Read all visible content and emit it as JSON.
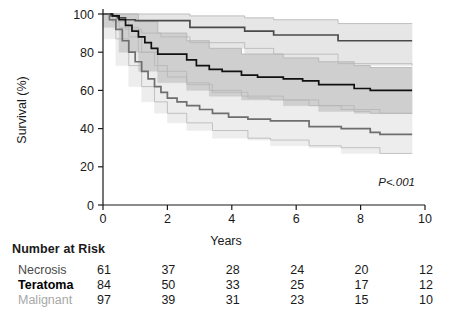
{
  "chart_data": {
    "type": "line",
    "title": "",
    "xlabel": "Years",
    "ylabel": "Survival (%)",
    "xlim": [
      0,
      10
    ],
    "ylim": [
      0,
      100
    ],
    "xticks": [
      0,
      2,
      4,
      6,
      8,
      10
    ],
    "yticks": [
      0,
      20,
      40,
      60,
      80,
      100
    ],
    "xtick_labels": [
      "0",
      "2",
      "4",
      "6",
      "8",
      "10"
    ],
    "ytick_labels": [
      "0",
      "20",
      "40",
      "60",
      "80",
      "100"
    ],
    "grid": false,
    "legend_position": "none",
    "annotation": "P<.001",
    "series": [
      {
        "name": "Necrosis",
        "color": "#4a4a4a",
        "band_color": "#e6e6e6",
        "points": [
          [
            0,
            100
          ],
          [
            0.25,
            99
          ],
          [
            0.45,
            98
          ],
          [
            0.7,
            97
          ],
          [
            1.0,
            96.5
          ],
          [
            1.6,
            96.5
          ],
          [
            2.6,
            96.5
          ],
          [
            2.7,
            93
          ],
          [
            4.3,
            93
          ],
          [
            4.4,
            91
          ],
          [
            5.2,
            91
          ],
          [
            5.3,
            89
          ],
          [
            7.2,
            89
          ],
          [
            7.3,
            86
          ],
          [
            9.6,
            86
          ]
        ],
        "band_upper": [
          [
            0,
            100
          ],
          [
            0.45,
            100
          ],
          [
            1.6,
            100
          ],
          [
            2.7,
            99
          ],
          [
            4.4,
            98
          ],
          [
            5.3,
            97
          ],
          [
            7.3,
            95
          ],
          [
            9.6,
            95
          ]
        ],
        "band_lower": [
          [
            0,
            100
          ],
          [
            0.3,
            96
          ],
          [
            0.7,
            92
          ],
          [
            1.2,
            90
          ],
          [
            1.8,
            88
          ],
          [
            2.7,
            85
          ],
          [
            4.4,
            82
          ],
          [
            5.3,
            79
          ],
          [
            7.3,
            74
          ],
          [
            9.6,
            73
          ]
        ],
        "final_value": 86
      },
      {
        "name": "Teratoma",
        "color": "#111111",
        "band_color": "#cfcfcf",
        "points": [
          [
            0,
            100
          ],
          [
            0.3,
            99
          ],
          [
            0.5,
            97
          ],
          [
            0.7,
            94
          ],
          [
            0.9,
            91
          ],
          [
            1.1,
            88
          ],
          [
            1.3,
            85
          ],
          [
            1.5,
            82
          ],
          [
            1.7,
            79
          ],
          [
            2.4,
            79
          ],
          [
            2.6,
            76
          ],
          [
            2.9,
            73
          ],
          [
            3.3,
            71
          ],
          [
            3.7,
            70
          ],
          [
            4.3,
            68
          ],
          [
            4.8,
            67
          ],
          [
            5.6,
            66
          ],
          [
            6.2,
            65
          ],
          [
            6.7,
            63
          ],
          [
            7.3,
            63
          ],
          [
            7.8,
            61
          ],
          [
            8.3,
            60
          ],
          [
            9.6,
            60
          ]
        ],
        "band_upper": [
          [
            0,
            100
          ],
          [
            0.5,
            100
          ],
          [
            1.1,
            96
          ],
          [
            1.7,
            90
          ],
          [
            2.6,
            86
          ],
          [
            3.3,
            82
          ],
          [
            4.3,
            79
          ],
          [
            5.6,
            77
          ],
          [
            6.7,
            75
          ],
          [
            7.8,
            73
          ],
          [
            8.3,
            72
          ],
          [
            9.6,
            72
          ]
        ],
        "band_lower": [
          [
            0,
            100
          ],
          [
            0.5,
            93
          ],
          [
            1.1,
            80
          ],
          [
            1.7,
            70
          ],
          [
            2.6,
            64
          ],
          [
            3.3,
            60
          ],
          [
            4.3,
            57
          ],
          [
            5.6,
            55
          ],
          [
            6.7,
            52
          ],
          [
            7.8,
            49
          ],
          [
            8.3,
            48
          ],
          [
            9.6,
            48
          ]
        ],
        "final_value": 60
      },
      {
        "name": "Malignant",
        "color": "#6e6e6e",
        "band_color": "#ededed",
        "points": [
          [
            0,
            100
          ],
          [
            0.2,
            97
          ],
          [
            0.4,
            92
          ],
          [
            0.6,
            86
          ],
          [
            0.8,
            80
          ],
          [
            1.0,
            75
          ],
          [
            1.2,
            70
          ],
          [
            1.4,
            66
          ],
          [
            1.6,
            62
          ],
          [
            1.8,
            59
          ],
          [
            2.0,
            56
          ],
          [
            2.3,
            54
          ],
          [
            2.6,
            52
          ],
          [
            3.0,
            50
          ],
          [
            3.4,
            48
          ],
          [
            3.9,
            46
          ],
          [
            4.5,
            45
          ],
          [
            5.2,
            44
          ],
          [
            6.0,
            44
          ],
          [
            6.4,
            41
          ],
          [
            7.4,
            40
          ],
          [
            8.3,
            38
          ],
          [
            8.6,
            37
          ],
          [
            9.6,
            37
          ]
        ],
        "band_upper": [
          [
            0,
            100
          ],
          [
            0.4,
            97
          ],
          [
            0.8,
            88
          ],
          [
            1.2,
            80
          ],
          [
            1.6,
            73
          ],
          [
            2.0,
            67
          ],
          [
            2.6,
            63
          ],
          [
            3.4,
            59
          ],
          [
            4.5,
            56
          ],
          [
            5.2,
            55
          ],
          [
            6.4,
            52
          ],
          [
            7.4,
            50
          ],
          [
            8.6,
            48
          ],
          [
            9.6,
            48
          ]
        ],
        "band_lower": [
          [
            0,
            100
          ],
          [
            0.4,
            87
          ],
          [
            0.8,
            73
          ],
          [
            1.2,
            62
          ],
          [
            1.6,
            54
          ],
          [
            2.0,
            48
          ],
          [
            2.6,
            43
          ],
          [
            3.4,
            39
          ],
          [
            4.5,
            35
          ],
          [
            5.2,
            34
          ],
          [
            6.4,
            31
          ],
          [
            7.4,
            30
          ],
          [
            8.6,
            27
          ],
          [
            9.6,
            27
          ]
        ],
        "final_value": 37
      }
    ]
  },
  "axis": {
    "y_title": "Survival (%)",
    "x_title": "Years",
    "pvalue": "P<.001"
  },
  "risk_table": {
    "title": "Number at Risk",
    "time_points": [
      0,
      2,
      4,
      6,
      8,
      10
    ],
    "rows": [
      {
        "group": "Necrosis",
        "values": [
          "61",
          "37",
          "28",
          "24",
          "20",
          "12"
        ]
      },
      {
        "group": "Teratoma",
        "values": [
          "84",
          "50",
          "33",
          "25",
          "17",
          "12"
        ]
      },
      {
        "group": "Malignant",
        "values": [
          "97",
          "39",
          "31",
          "23",
          "15",
          "10"
        ]
      }
    ]
  }
}
